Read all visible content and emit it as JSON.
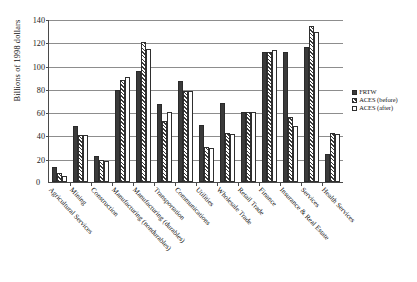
{
  "chart_data": {
    "type": "bar",
    "title": "",
    "xlabel": "",
    "ylabel": "Billions of 1998 dollars",
    "ylim": [
      0,
      140
    ],
    "yticks": [
      0,
      20,
      40,
      60,
      80,
      100,
      120,
      140
    ],
    "grid": true,
    "legend_position": "right",
    "categories": [
      "Agricultural Services",
      "Mining",
      "Construction",
      "Manufacturing (nondurables)",
      "Manufacturing (durables)",
      "Transportation",
      "Communications",
      "Utilities",
      "Wholesale Trade",
      "Retail Trade",
      "Finance",
      "Insurance & Real Estate",
      "Services",
      "Health Services"
    ],
    "series": [
      {
        "name": "FRTW",
        "color": "#3a3a3a",
        "values": [
          13,
          48,
          22,
          79,
          95,
          67,
          87,
          49,
          68,
          60,
          112,
          112,
          116,
          24
        ]
      },
      {
        "name": "ACES (before)",
        "color": "#efefef",
        "values": [
          8,
          40,
          19,
          88,
          120,
          52,
          78,
          30,
          42,
          60,
          112,
          56,
          134,
          42
        ]
      },
      {
        "name": "ACES (after)",
        "color": "#ffffff",
        "values": [
          5,
          40,
          18,
          90,
          114,
          60,
          78,
          29,
          41,
          60,
          113,
          48,
          129,
          41
        ]
      }
    ]
  },
  "legend": {
    "items": [
      {
        "label": "FRTW",
        "swatch": "solid-dark-swatch"
      },
      {
        "label": "ACES (before)",
        "swatch": "hatched-swatch"
      },
      {
        "label": "ACES (after)",
        "swatch": "white-outline-swatch"
      }
    ]
  },
  "axis": {
    "zero_label": "0"
  }
}
